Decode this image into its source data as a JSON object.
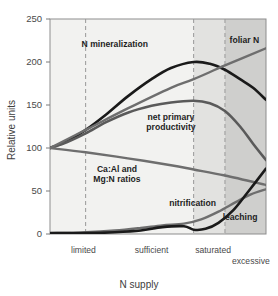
{
  "chart_data": {
    "type": "line",
    "title": "",
    "xlabel": "N supply",
    "ylabel": "Relative units",
    "ylim": [
      0,
      250
    ],
    "yticks": [
      0,
      50,
      100,
      150,
      200,
      250
    ],
    "ytick_labels": [
      "0",
      "50",
      "100",
      "150",
      "200",
      "250"
    ],
    "grid": false,
    "legend_position": "inline-annotations",
    "x_categories": [
      "limited",
      "sufficient",
      "saturated",
      "excessive"
    ],
    "x_category_positions": [
      0.155,
      0.47,
      0.755,
      0.93
    ],
    "x_stage_dividers": [
      0.165,
      0.665,
      0.81
    ],
    "x_range": [
      0,
      1
    ],
    "shaded_bands": [
      {
        "from": 0.0,
        "to": 0.665,
        "color": "#f2f2f0"
      },
      {
        "from": 0.665,
        "to": 0.81,
        "color": "#e2e2e0"
      },
      {
        "from": 0.81,
        "to": 1.0,
        "color": "#cfcfcd"
      }
    ],
    "series": [
      {
        "name": "N mineralization",
        "color": "#1a1a1a",
        "width": 2.6,
        "label": "N mineralization",
        "label_x": 0.3,
        "label_y": 218,
        "x": [
          0.0,
          0.08,
          0.165,
          0.26,
          0.36,
          0.47,
          0.56,
          0.665,
          0.74,
          0.81,
          0.88,
          0.94,
          1.0
        ],
        "y": [
          100,
          108,
          121,
          139,
          160,
          180,
          193,
          200,
          198,
          191,
          180,
          170,
          156
        ]
      },
      {
        "name": "net primary productivity",
        "color": "#5a5a5a",
        "width": 2.6,
        "label": "net primary\nproductivity",
        "label_x": 0.56,
        "label_y": 133,
        "x": [
          0.0,
          0.08,
          0.165,
          0.26,
          0.36,
          0.47,
          0.56,
          0.665,
          0.74,
          0.81,
          0.88,
          0.94,
          1.0
        ],
        "y": [
          100,
          107,
          117,
          130,
          141,
          149,
          153,
          155,
          152,
          143,
          125,
          105,
          86
        ]
      },
      {
        "name": "foliar N",
        "color": "#6e6e6e",
        "width": 2.4,
        "label": "foliar N",
        "label_x": 0.9,
        "label_y": 222,
        "x": [
          0.0,
          0.165,
          0.36,
          0.56,
          0.665,
          0.81,
          1.0
        ],
        "y": [
          100,
          121,
          146,
          170,
          180,
          196,
          216
        ]
      },
      {
        "name": "Ca:Al and Mg:N ratios",
        "color": "#6e6e6e",
        "width": 2.4,
        "label": "Ca:Al and\nMg:N ratios",
        "label_x": 0.31,
        "label_y": 72,
        "x": [
          0.0,
          0.165,
          0.36,
          0.56,
          0.665,
          0.81,
          1.0
        ],
        "y": [
          100,
          95,
          88,
          80,
          75,
          68,
          57
        ]
      },
      {
        "name": "nitrification",
        "color": "#6e6e6e",
        "width": 2.4,
        "label": "nitrification",
        "label_x": 0.66,
        "label_y": 32,
        "x": [
          0.0,
          0.165,
          0.3,
          0.42,
          0.52,
          0.62,
          0.7,
          0.78,
          0.86,
          0.93,
          1.0
        ],
        "y": [
          1,
          2,
          4,
          7,
          10,
          12,
          17,
          26,
          37,
          46,
          52
        ]
      },
      {
        "name": "leaching",
        "color": "#1a1a1a",
        "width": 2.6,
        "label": "leaching",
        "label_x": 0.88,
        "label_y": 16,
        "x": [
          0.0,
          0.165,
          0.3,
          0.42,
          0.52,
          0.62,
          0.665,
          0.72,
          0.78,
          0.85,
          0.92,
          1.0
        ],
        "y": [
          1,
          1,
          2,
          4,
          8,
          9,
          5,
          6,
          13,
          28,
          50,
          76
        ]
      }
    ]
  },
  "labels": {
    "y_axis_title": "Relative units",
    "x_axis_title": "N supply",
    "ticks": [
      "250",
      "200",
      "150",
      "100",
      "50",
      "0"
    ],
    "categories": [
      "limited",
      "sufficient",
      "saturated",
      "excessive"
    ],
    "series_names": [
      "N mineralization",
      "net primary",
      "productivity",
      "foliar N",
      "Ca:Al and",
      "Mg:N ratios",
      "nitrification",
      "leaching"
    ]
  },
  "colors": {
    "dark_curve": "#1a1a1a",
    "mid_curve": "#5a5a5a",
    "light_curve": "#6e6e6e",
    "axis": "#7a7a7a",
    "dash": "#999999",
    "band_light": "#f2f2f0",
    "band_mid": "#e2e2e0",
    "band_dark": "#cfcfcd",
    "text": "#4a4a4a"
  }
}
